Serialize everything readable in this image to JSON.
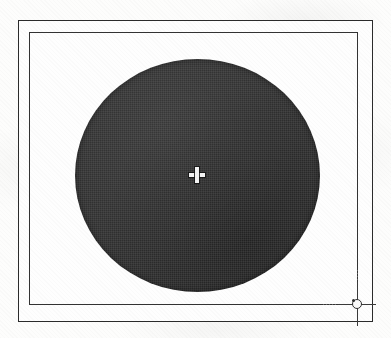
{
  "figure": {
    "kind": "cad-drawing-canvas",
    "caption": "",
    "background_color": "#fdfdfc"
  },
  "outer_frame": {
    "name": "outer drawing border",
    "stroke_color": "#2b2b2b",
    "x": 18,
    "y": 20,
    "width": 355,
    "height": 302
  },
  "inner_frame": {
    "name": "inner drawing border",
    "stroke_color": "#333333",
    "x": 28,
    "y": 31,
    "width": 329,
    "height": 273
  },
  "circle": {
    "name": "filled circle",
    "fill_color": "#2f2f2f",
    "center_x": 196,
    "center_y": 174,
    "width": 245,
    "height": 233,
    "radius_x": 123,
    "radius_y": 117
  },
  "center_mark": {
    "name": "center point marker",
    "icon": "plus-crosshair-icon",
    "color": "#f4f4f4",
    "x": 196,
    "y": 174
  },
  "cursor": {
    "name": "crosshair pick cursor",
    "icon": "crosshair-cursor-icon",
    "color": "#3a3a3a",
    "x": 356,
    "y": 303
  }
}
